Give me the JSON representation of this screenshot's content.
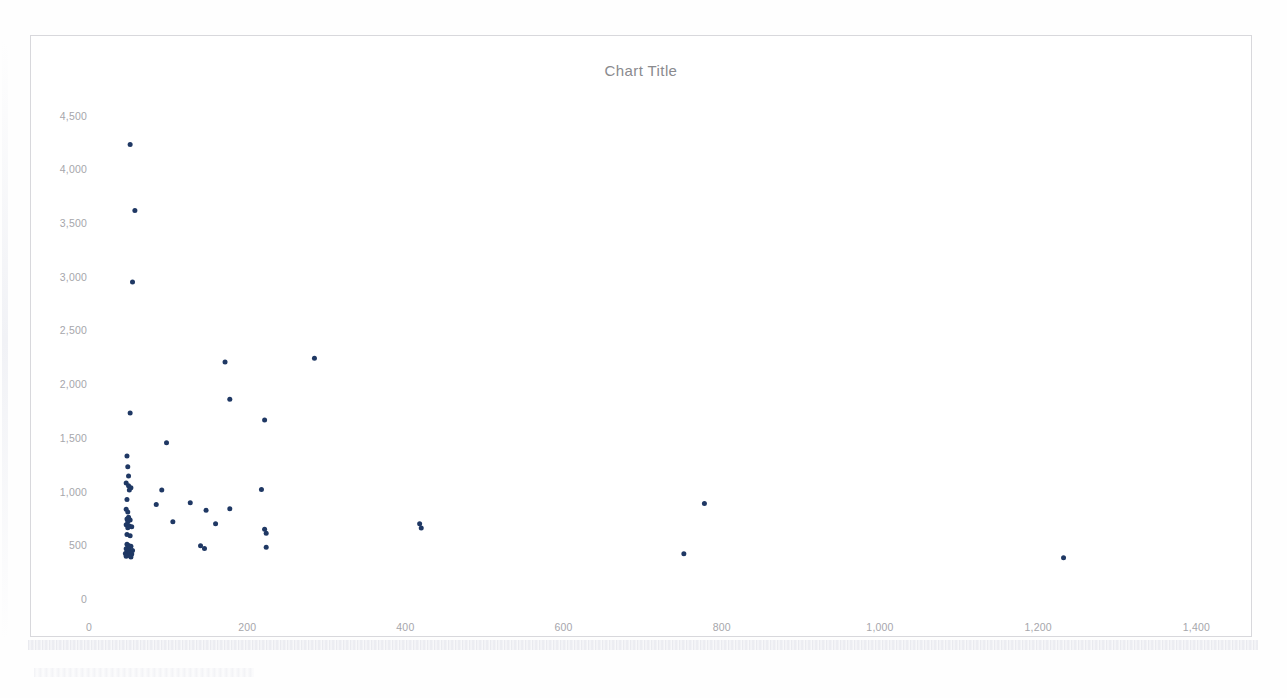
{
  "chart_data": {
    "type": "scatter",
    "title": "Chart Title",
    "xlabel": "",
    "ylabel": "",
    "xlim": [
      0,
      1450
    ],
    "ylim": [
      0,
      4700
    ],
    "grid": false,
    "legend": false,
    "marker_color": "#1f3864",
    "marker_size_px": 5,
    "x_ticks": [
      0,
      200,
      400,
      600,
      800,
      1000,
      1200,
      1400
    ],
    "x_tick_labels": [
      "0",
      "200",
      "400",
      "600",
      "800",
      "1,000",
      "1,200",
      "1,400"
    ],
    "y_ticks": [
      0,
      500,
      1000,
      1500,
      2000,
      2500,
      3000,
      3500,
      4000,
      4500
    ],
    "y_tick_labels": [
      "0",
      "500",
      "1,000",
      "1,500",
      "2,000",
      "2,500",
      "3,000",
      "3,500",
      "4,000",
      "4,500"
    ],
    "series": [
      {
        "name": "Series 1",
        "points": [
          [
            52,
            4230
          ],
          [
            58,
            3615
          ],
          [
            55,
            2950
          ],
          [
            172,
            2205
          ],
          [
            285,
            2240
          ],
          [
            178,
            1860
          ],
          [
            222,
            1665
          ],
          [
            52,
            1730
          ],
          [
            98,
            1455
          ],
          [
            48,
            1330
          ],
          [
            49,
            1230
          ],
          [
            50,
            1145
          ],
          [
            47,
            1080
          ],
          [
            50,
            1055
          ],
          [
            53,
            1035
          ],
          [
            51,
            1015
          ],
          [
            92,
            1015
          ],
          [
            218,
            1020
          ],
          [
            48,
            925
          ],
          [
            128,
            895
          ],
          [
            85,
            880
          ],
          [
            47,
            835
          ],
          [
            49,
            810
          ],
          [
            178,
            840
          ],
          [
            148,
            825
          ],
          [
            50,
            760
          ],
          [
            48,
            745
          ],
          [
            52,
            735
          ],
          [
            49,
            720
          ],
          [
            106,
            718
          ],
          [
            160,
            700
          ],
          [
            418,
            700
          ],
          [
            420,
            660
          ],
          [
            47,
            690
          ],
          [
            51,
            680
          ],
          [
            54,
            672
          ],
          [
            49,
            662
          ],
          [
            222,
            648
          ],
          [
            224,
            612
          ],
          [
            48,
            600
          ],
          [
            52,
            588
          ],
          [
            48,
            510
          ],
          [
            50,
            498
          ],
          [
            53,
            490
          ],
          [
            49,
            478
          ],
          [
            47,
            468
          ],
          [
            51,
            460
          ],
          [
            55,
            452
          ],
          [
            50,
            445
          ],
          [
            48,
            438
          ],
          [
            52,
            430
          ],
          [
            46,
            424
          ],
          [
            54,
            418
          ],
          [
            49,
            412
          ],
          [
            51,
            405
          ],
          [
            47,
            398
          ],
          [
            53,
            392
          ],
          [
            141,
            495
          ],
          [
            146,
            470
          ],
          [
            224,
            482
          ],
          [
            778,
            888
          ],
          [
            752,
            420
          ],
          [
            1232,
            385
          ]
        ]
      }
    ]
  }
}
